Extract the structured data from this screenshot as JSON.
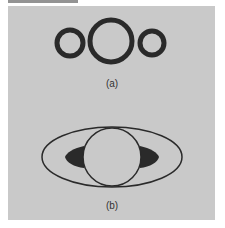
{
  "header": {
    "cropped_text": ""
  },
  "figure": {
    "background": "#c9c9c9",
    "stroke": "#2a2a2a",
    "panels": [
      {
        "id": "a",
        "label": "(a)",
        "description": "three linked rings: small, large, small",
        "shapes": [
          {
            "type": "ring",
            "cx": 70,
            "cy": 43,
            "r": 13,
            "stroke_width": 5
          },
          {
            "type": "ring",
            "cx": 111,
            "cy": 41,
            "r": 21,
            "stroke_width": 5
          },
          {
            "type": "ring",
            "cx": 152,
            "cy": 43,
            "r": 12,
            "stroke_width": 5
          }
        ],
        "label_pos": {
          "x": 112,
          "y": 78
        }
      },
      {
        "id": "b",
        "label": "(b)",
        "description": "planet with ring seen edge-tilted, dark shadow crescents on both sides",
        "shapes": [
          {
            "type": "ellipse",
            "cx": 112,
            "cy": 157,
            "rx": 70,
            "ry": 30,
            "stroke_width": 1.5
          },
          {
            "type": "circle",
            "cx": 112,
            "cy": 157,
            "r": 29,
            "stroke_width": 1.5
          },
          {
            "type": "shadow",
            "side": "left"
          },
          {
            "type": "shadow",
            "side": "right"
          }
        ],
        "label_pos": {
          "x": 112,
          "y": 200
        }
      }
    ]
  }
}
